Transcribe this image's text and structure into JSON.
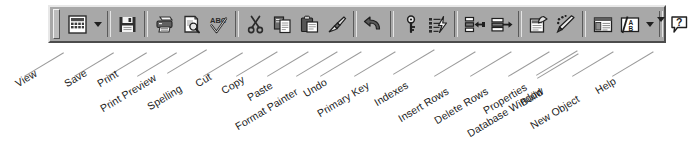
{
  "toolbar": {
    "name": "Access Table Design toolbar",
    "background_color": "#a8a8a8",
    "grip_label": "toolbar-grip",
    "buttons": [
      {
        "id": "view",
        "label": "View",
        "icon": "grid-table-icon",
        "has_dropdown": true,
        "x": 62
      },
      {
        "id": "save",
        "label": "Save",
        "icon": "floppy-disk-icon",
        "has_dropdown": false,
        "x": 112
      },
      {
        "id": "print",
        "label": "Print",
        "icon": "printer-icon",
        "has_dropdown": false,
        "x": 145
      },
      {
        "id": "print-preview",
        "label": "Print Preview",
        "icon": "page-magnifier-icon",
        "has_dropdown": false,
        "x": 173
      },
      {
        "id": "spelling",
        "label": "Spelling",
        "icon": "abc-check-icon",
        "has_dropdown": false,
        "x": 201
      },
      {
        "id": "cut",
        "label": "Cut",
        "icon": "scissors-icon",
        "has_dropdown": false,
        "x": 236
      },
      {
        "id": "copy",
        "label": "Copy",
        "icon": "copy-pages-icon",
        "has_dropdown": false,
        "x": 264
      },
      {
        "id": "paste",
        "label": "Paste",
        "icon": "clipboard-paste-icon",
        "has_dropdown": false,
        "x": 292
      },
      {
        "id": "format-painter",
        "label": "Format Painter",
        "icon": "paintbrush-icon",
        "has_dropdown": false,
        "x": 320
      },
      {
        "id": "undo",
        "label": "Undo",
        "icon": "undo-arrow-icon",
        "has_dropdown": false,
        "x": 355
      },
      {
        "id": "primary-key",
        "label": "Primary Key",
        "icon": "key-icon",
        "has_dropdown": false,
        "x": 390
      },
      {
        "id": "indexes",
        "label": "Indexes",
        "icon": "indexes-lightning-icon",
        "has_dropdown": false,
        "x": 418
      },
      {
        "id": "insert-rows",
        "label": "Insert Rows",
        "icon": "insert-rows-icon",
        "has_dropdown": false,
        "x": 453
      },
      {
        "id": "delete-rows",
        "label": "Delete Rows",
        "icon": "delete-rows-icon",
        "has_dropdown": false,
        "x": 481
      },
      {
        "id": "properties",
        "label": "Properties",
        "icon": "properties-hand-icon",
        "has_dropdown": false,
        "x": 516
      },
      {
        "id": "build",
        "label": "Build",
        "icon": "magic-wand-icon",
        "has_dropdown": false,
        "x": 544
      },
      {
        "id": "database-window",
        "label": "Database Window",
        "icon": "database-window-icon",
        "has_dropdown": false,
        "x": 579
      },
      {
        "id": "new-object",
        "label": "New Object",
        "icon": "new-object-icon",
        "has_dropdown": true,
        "x": 607
      },
      {
        "id": "help",
        "label": "Help",
        "icon": "help-question-icon",
        "has_dropdown": true,
        "x": 645
      }
    ]
  },
  "callouts": [
    {
      "id": "view",
      "label": "View",
      "label_x": 16,
      "label_y": 78,
      "line_x": 24,
      "line_y": 76,
      "line_len": 46
    },
    {
      "id": "save",
      "label": "Save",
      "label_x": 65,
      "label_y": 78,
      "line_x": 74,
      "line_y": 76,
      "line_len": 46
    },
    {
      "id": "print",
      "label": "Print",
      "label_x": 98,
      "label_y": 78,
      "line_x": 107,
      "line_y": 76,
      "line_len": 46
    },
    {
      "id": "print-preview",
      "label": "Print Preview",
      "label_x": 101,
      "label_y": 103,
      "line_x": 137,
      "line_y": 76,
      "line_len": 46
    },
    {
      "id": "spelling",
      "label": "Spelling",
      "label_x": 148,
      "label_y": 101,
      "line_x": 167,
      "line_y": 73,
      "line_len": 46
    },
    {
      "id": "cut",
      "label": "Cut",
      "label_x": 196,
      "label_y": 78,
      "line_x": 203,
      "line_y": 76,
      "line_len": 46
    },
    {
      "id": "copy",
      "label": "Copy",
      "label_x": 222,
      "label_y": 85,
      "line_x": 236,
      "line_y": 76,
      "line_len": 48
    },
    {
      "id": "paste",
      "label": "Paste",
      "label_x": 248,
      "label_y": 92,
      "line_x": 267,
      "line_y": 76,
      "line_len": 48
    },
    {
      "id": "format-painter",
      "label": "Format Painter",
      "label_x": 236,
      "label_y": 121,
      "line_x": 296,
      "line_y": 76,
      "line_len": 48
    },
    {
      "id": "undo",
      "label": "Undo",
      "label_x": 304,
      "label_y": 88,
      "line_x": 320,
      "line_y": 76,
      "line_len": 48
    },
    {
      "id": "primary-key",
      "label": "Primary Key",
      "label_x": 318,
      "label_y": 108,
      "line_x": 354,
      "line_y": 76,
      "line_len": 48
    },
    {
      "id": "indexes",
      "label": "Indexes",
      "label_x": 375,
      "label_y": 97,
      "line_x": 393,
      "line_y": 74,
      "line_len": 48
    },
    {
      "id": "insert-rows",
      "label": "Insert Rows",
      "label_x": 399,
      "label_y": 113,
      "line_x": 434,
      "line_y": 76,
      "line_len": 48
    },
    {
      "id": "delete-rows",
      "label": "Delete Rows",
      "label_x": 435,
      "label_y": 115,
      "line_x": 470,
      "line_y": 76,
      "line_len": 48
    },
    {
      "id": "properties",
      "label": "Properties",
      "label_x": 484,
      "label_y": 105,
      "line_x": 508,
      "line_y": 76,
      "line_len": 48
    },
    {
      "id": "build",
      "label": "Build",
      "label_x": 521,
      "label_y": 97,
      "line_x": 536,
      "line_y": 75,
      "line_len": 48
    },
    {
      "id": "database-window",
      "label": "Database Window",
      "label_x": 468,
      "label_y": 128,
      "line_x": 537,
      "line_y": 78,
      "line_len": 48
    },
    {
      "id": "new-object",
      "label": "New Object",
      "label_x": 531,
      "label_y": 120,
      "line_x": 572,
      "line_y": 76,
      "line_len": 48
    },
    {
      "id": "help",
      "label": "Help",
      "label_x": 596,
      "label_y": 85,
      "line_x": 612,
      "line_y": 76,
      "line_len": 48
    }
  ]
}
